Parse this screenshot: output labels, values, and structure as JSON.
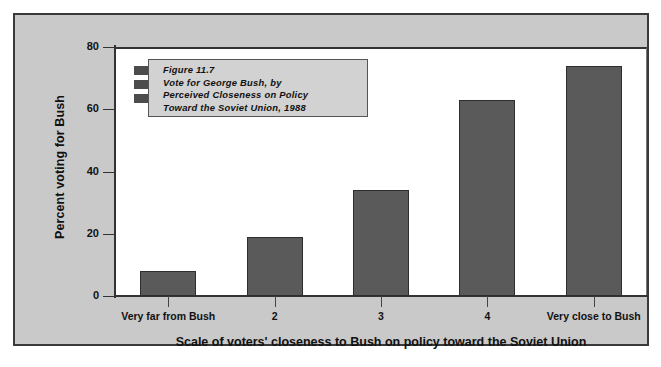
{
  "figure": {
    "caption_lines": [
      "Figure 11.7",
      "Vote for George Bush, by",
      "Perceived Closeness on Policy",
      "Toward the Soviet Union, 1988"
    ],
    "legend_swatch_name": "legend-bar-swatch"
  },
  "colors": {
    "panel_background": "#c9c9c9",
    "plot_background": "#ffffff",
    "bar_fill": "#5a5a5a",
    "bar_border": "#2e2e2e",
    "axis": "#333333",
    "title_box_background": "#d2d2d2"
  },
  "chart_data": {
    "type": "bar",
    "title": "Figure 11.7 Vote for George Bush, by Perceived Closeness on Policy Toward the Soviet Union, 1988",
    "categories": [
      "Very far from Bush",
      "2",
      "3",
      "4",
      "Very close to Bush"
    ],
    "values": [
      8,
      19,
      34,
      63,
      74
    ],
    "xlabel": "Scale of voters' closeness to Bush on policy toward the Soviet Union",
    "ylabel": "Percent voting for Bush",
    "ylim": [
      0,
      80
    ],
    "yticks": [
      0,
      20,
      40,
      60,
      80
    ],
    "ytick_labels": [
      "0",
      "20",
      "40",
      "60",
      "80"
    ],
    "grid": false,
    "legend": "none",
    "series": [
      {
        "name": "Percent voting for Bush",
        "values": [
          8,
          19,
          34,
          63,
          74
        ]
      }
    ]
  }
}
